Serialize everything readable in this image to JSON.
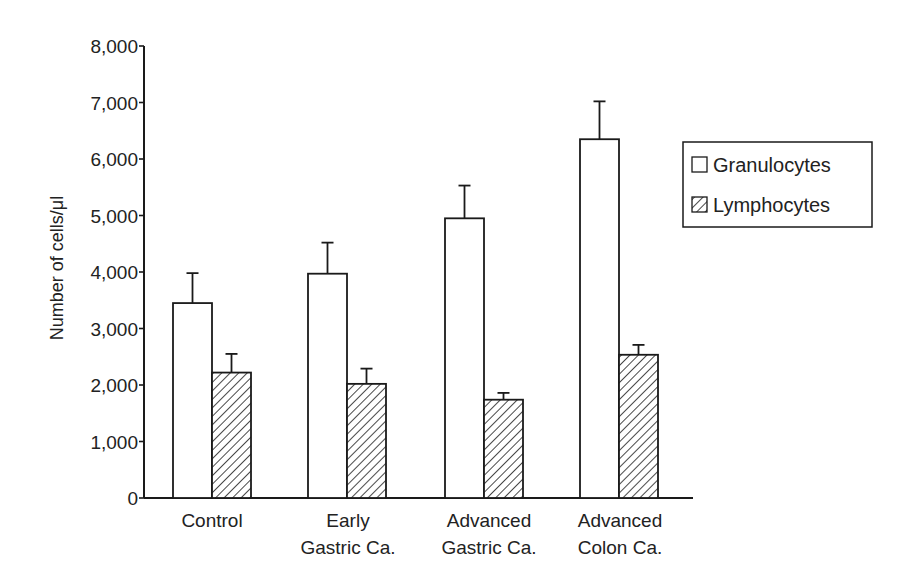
{
  "chart_data": {
    "type": "bar",
    "title": "",
    "xlabel": "",
    "ylabel": "Number of cells/μl",
    "ylim": [
      0,
      8000
    ],
    "yticks": [
      0,
      1000,
      2000,
      3000,
      4000,
      5000,
      6000,
      7000,
      8000
    ],
    "ytick_labels": [
      "0",
      "1,000",
      "2,000",
      "3,000",
      "4,000",
      "5,000",
      "6,000",
      "7,000",
      "8,000"
    ],
    "categories": [
      "Control",
      "Early Gastric Ca.",
      "Advanced Gastric Ca.",
      "Advanced Colon Ca."
    ],
    "category_lines": [
      [
        "Control"
      ],
      [
        "Early",
        "Gastric Ca."
      ],
      [
        "Advanced",
        "Gastric Ca."
      ],
      [
        "Advanced",
        "Colon Ca."
      ]
    ],
    "series": [
      {
        "name": "Granulocytes",
        "pattern": "open",
        "values": [
          3450,
          3970,
          4950,
          6350
        ],
        "error_upper": [
          3980,
          4520,
          5530,
          7020
        ]
      },
      {
        "name": "Lymphocytes",
        "pattern": "hatched",
        "values": [
          2220,
          2020,
          1740,
          2535
        ],
        "error_upper": [
          2550,
          2290,
          1860,
          2710
        ]
      }
    ],
    "legend": {
      "position": "right",
      "entries": [
        "Granulocytes",
        "Lymphocytes"
      ]
    },
    "grid": false
  },
  "colors": {
    "ink": "#1a1a1a",
    "background": "#ffffff"
  }
}
